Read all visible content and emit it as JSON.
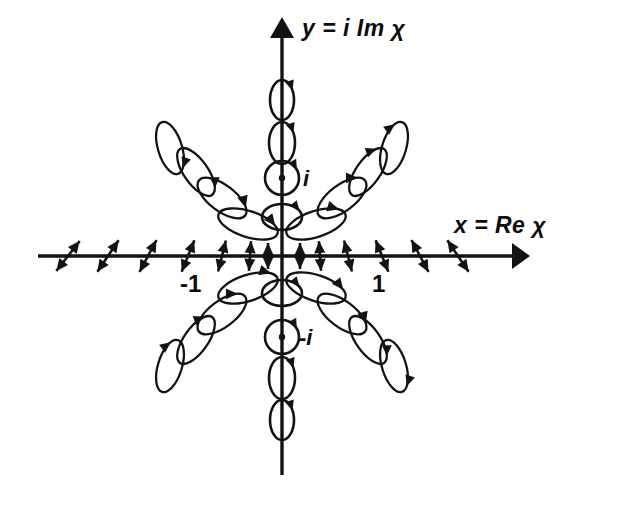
{
  "figure": {
    "background_color": "#ffffff",
    "ink_color": "#131313"
  },
  "labels": {
    "y_axis": "y = i Im χ",
    "x_axis": "x = Re χ",
    "tick_neg_one": "-1",
    "tick_pos_one": "1",
    "tick_i": "i",
    "tick_neg_i": "-i"
  },
  "chart_data": {
    "type": "scatter",
    "xlabel": "x = Re χ",
    "ylabel": "y = i Im χ",
    "grid": false,
    "legend": false,
    "origin_px": [
      282,
      256
    ],
    "unit_px": 100,
    "xlim": [
      -2.45,
      2.45
    ],
    "ylim": [
      -2.2,
      2.4
    ],
    "xticks": [
      -1,
      1
    ],
    "xticklabels": [
      "-1",
      "1"
    ],
    "yticks": [
      1,
      -1
    ],
    "yticklabels": [
      "i",
      "-i"
    ],
    "axes": {
      "x_axis_px": {
        "x1": 38,
        "x2": 528,
        "y": 256,
        "arrow": "right"
      },
      "y_axis_px": {
        "y1": 18,
        "y2": 475,
        "x": 282,
        "arrow": "up"
      }
    },
    "annotations": [
      {
        "text": "i",
        "px": [
          303,
          178
        ],
        "style": "italic"
      },
      {
        "text": "-i",
        "px": [
          299,
          337
        ],
        "style": "italic"
      },
      {
        "text": "-1",
        "px": [
          190,
          284
        ],
        "style": "normal"
      },
      {
        "text": "1",
        "px": [
          377,
          284
        ],
        "style": "normal"
      }
    ],
    "markers": {
      "y_axis": {
        "kind": "circular-polarization",
        "description": "near-circular ellipses along the imaginary axis; perfect circles with centre dot at +i and -i",
        "items": [
          {
            "px": [
              282,
              100
            ],
            "rx": 12,
            "ry": 20,
            "angle": 0,
            "handed": "right",
            "dot": false
          },
          {
            "px": [
              282,
              143
            ],
            "rx": 13,
            "ry": 21,
            "angle": 0,
            "handed": "right",
            "dot": false
          },
          {
            "px": [
              282,
              178
            ],
            "rx": 17,
            "ry": 17,
            "angle": 0,
            "handed": "right",
            "dot": true
          },
          {
            "px": [
              282,
              217
            ],
            "rx": 20,
            "ry": 13,
            "angle": 0,
            "handed": "right",
            "dot": false
          },
          {
            "px": [
              282,
              293
            ],
            "rx": 20,
            "ry": 13,
            "angle": 0,
            "handed": "right",
            "dot": false
          },
          {
            "px": [
              282,
              337
            ],
            "rx": 17,
            "ry": 17,
            "angle": 0,
            "handed": "right",
            "dot": true
          },
          {
            "px": [
              282,
              378
            ],
            "rx": 13,
            "ry": 21,
            "angle": 0,
            "handed": "right",
            "dot": false
          },
          {
            "px": [
              282,
              420
            ],
            "rx": 12,
            "ry": 20,
            "angle": 0,
            "handed": "right",
            "dot": false
          }
        ]
      },
      "x_axis": {
        "kind": "linear-polarization",
        "description": "double-headed arrows along the real axis; tilt increases away from origin",
        "items": [
          {
            "px": [
              68,
              256
            ],
            "len": 38,
            "angle": -52
          },
          {
            "px": [
              108,
              256
            ],
            "len": 38,
            "angle": -56
          },
          {
            "px": [
              148,
              256
            ],
            "len": 36,
            "angle": -62
          },
          {
            "px": [
              188,
              256
            ],
            "len": 34,
            "angle": -68
          },
          {
            "px": [
              222,
              256
            ],
            "len": 32,
            "angle": -76
          },
          {
            "px": [
              250,
              256
            ],
            "len": 30,
            "angle": -86
          },
          {
            "px": [
              268,
              256
            ],
            "len": 26,
            "angle": -90
          },
          {
            "px": [
              300,
              256
            ],
            "len": 26,
            "angle": 90
          },
          {
            "px": [
              320,
              256
            ],
            "len": 30,
            "angle": 86
          },
          {
            "px": [
              348,
              256
            ],
            "len": 32,
            "angle": 76
          },
          {
            "px": [
              382,
              256
            ],
            "len": 34,
            "angle": 68
          },
          {
            "px": [
              420,
              256
            ],
            "len": 36,
            "angle": 62
          },
          {
            "px": [
              458,
              256
            ],
            "len": 38,
            "angle": 56
          }
        ]
      },
      "quadrant_upper_left": {
        "kind": "elliptical-polarization",
        "items": [
          {
            "px": [
              248,
              224
            ],
            "rx": 31,
            "ry": 13,
            "angle": 18,
            "handed": "right"
          },
          {
            "px": [
              222,
              198
            ],
            "rx": 29,
            "ry": 13,
            "angle": 37,
            "handed": "right"
          },
          {
            "px": [
              196,
              172
            ],
            "rx": 28,
            "ry": 12,
            "angle": 55,
            "handed": "right"
          },
          {
            "px": [
              170,
              148
            ],
            "rx": 27,
            "ry": 12,
            "angle": 73,
            "handed": "right"
          }
        ]
      },
      "quadrant_upper_right": {
        "kind": "elliptical-polarization",
        "items": [
          {
            "px": [
              316,
              224
            ],
            "rx": 31,
            "ry": 13,
            "angle": -18,
            "handed": "right"
          },
          {
            "px": [
              342,
              198
            ],
            "rx": 29,
            "ry": 13,
            "angle": -37,
            "handed": "right"
          },
          {
            "px": [
              368,
              172
            ],
            "rx": 28,
            "ry": 12,
            "angle": -55,
            "handed": "right"
          },
          {
            "px": [
              394,
              148
            ],
            "rx": 27,
            "ry": 12,
            "angle": -73,
            "handed": "right"
          }
        ]
      },
      "quadrant_lower_left": {
        "kind": "elliptical-polarization",
        "items": [
          {
            "px": [
              248,
              288
            ],
            "rx": 31,
            "ry": 13,
            "angle": -18,
            "handed": "right"
          },
          {
            "px": [
              222,
              314
            ],
            "rx": 29,
            "ry": 13,
            "angle": -37,
            "handed": "right"
          },
          {
            "px": [
              196,
              340
            ],
            "rx": 28,
            "ry": 12,
            "angle": -55,
            "handed": "right"
          },
          {
            "px": [
              170,
              366
            ],
            "rx": 27,
            "ry": 12,
            "angle": -73,
            "handed": "right"
          }
        ]
      },
      "quadrant_lower_right": {
        "kind": "elliptical-polarization",
        "items": [
          {
            "px": [
              316,
              288
            ],
            "rx": 31,
            "ry": 13,
            "angle": 18,
            "handed": "right"
          },
          {
            "px": [
              342,
              314
            ],
            "rx": 29,
            "ry": 13,
            "angle": 37,
            "handed": "right"
          },
          {
            "px": [
              368,
              340
            ],
            "rx": 28,
            "ry": 12,
            "angle": 55,
            "handed": "right"
          },
          {
            "px": [
              394,
              366
            ],
            "rx": 27,
            "ry": 12,
            "angle": 73,
            "handed": "right"
          }
        ]
      }
    }
  }
}
